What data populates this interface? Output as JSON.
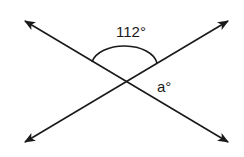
{
  "diagram": {
    "type": "intersecting-lines-angle",
    "labels": {
      "known_angle": "112°",
      "unknown_angle": "a°"
    },
    "colors": {
      "stroke": "#1a1a1a",
      "background": "#ffffff"
    }
  }
}
